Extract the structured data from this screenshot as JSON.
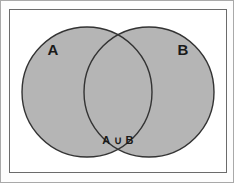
{
  "figure": {
    "frame": {
      "stroke_color": "#6b6b6b",
      "fill_color": "#ffffff",
      "x": 8,
      "y": 8,
      "width": 218,
      "height": 164
    },
    "background_color": "#fdfdfd",
    "outer_border_color": "#a9a9a9"
  },
  "diagram": {
    "type": "venn",
    "shaded_region": "A ∪ B",
    "fill_color": "#b5b5b5",
    "stroke_color": "#333333",
    "sets": [
      {
        "id": "set-a",
        "label": "A",
        "cx": 86,
        "cy": 91,
        "r": 65,
        "label_x": 52,
        "label_y": 54
      },
      {
        "id": "set-b",
        "label": "B",
        "cx": 148,
        "cy": 91,
        "r": 65,
        "label_x": 182,
        "label_y": 54
      }
    ],
    "union": {
      "label": "A ∪ B",
      "label_x": 117,
      "label_y": 143
    }
  }
}
